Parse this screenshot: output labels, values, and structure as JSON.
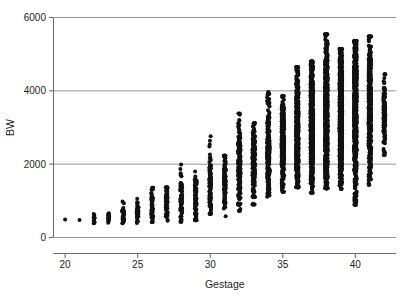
{
  "chart_data": {
    "type": "scatter",
    "title": "",
    "xlabel": "Gestage",
    "ylabel": "BW",
    "xlim": [
      19.2,
      42.8
    ],
    "ylim": [
      0,
      6000
    ],
    "xticks": [
      20,
      25,
      30,
      35,
      40
    ],
    "yticks": [
      0,
      2000,
      4000,
      6000
    ],
    "grid": "horizontal",
    "legend": "none",
    "marker": "filled-circle",
    "marker_color": "#111111",
    "marker_size_px": 3.2,
    "gridline_color": "#8a8a8a",
    "axis_color": "#6e6e6e",
    "columns": [
      {
        "x": 20,
        "n": 1,
        "min": 490,
        "max": 500,
        "median": 495
      },
      {
        "x": 21,
        "n": 1,
        "min": 480,
        "max": 495,
        "median": 490
      },
      {
        "x": 22,
        "n": 12,
        "min": 390,
        "max": 640,
        "median": 500
      },
      {
        "x": 23,
        "n": 16,
        "min": 400,
        "max": 660,
        "median": 530
      },
      {
        "x": 24,
        "n": 34,
        "min": 390,
        "max": 985,
        "median": 640
      },
      {
        "x": 25,
        "n": 42,
        "min": 395,
        "max": 1060,
        "median": 720
      },
      {
        "x": 26,
        "n": 50,
        "min": 420,
        "max": 1355,
        "median": 820
      },
      {
        "x": 27,
        "n": 56,
        "min": 455,
        "max": 1370,
        "median": 930
      },
      {
        "x": 28,
        "n": 70,
        "min": 430,
        "max": 1990,
        "median": 1050
      },
      {
        "x": 29,
        "n": 78,
        "min": 470,
        "max": 1800,
        "median": 1180
      },
      {
        "x": 30,
        "n": 96,
        "min": 650,
        "max": 2760,
        "median": 1380
      },
      {
        "x": 31,
        "n": 110,
        "min": 580,
        "max": 2230,
        "median": 1600
      },
      {
        "x": 32,
        "n": 150,
        "min": 730,
        "max": 3380,
        "median": 1820
      },
      {
        "x": 33,
        "n": 175,
        "min": 900,
        "max": 3120,
        "median": 2030
      },
      {
        "x": 34,
        "n": 230,
        "min": 1110,
        "max": 3970,
        "median": 2320
      },
      {
        "x": 35,
        "n": 300,
        "min": 1250,
        "max": 3860,
        "median": 2580
      },
      {
        "x": 36,
        "n": 430,
        "min": 1370,
        "max": 4650,
        "median": 2830
      },
      {
        "x": 37,
        "n": 640,
        "min": 1220,
        "max": 4800,
        "median": 3080
      },
      {
        "x": 38,
        "n": 860,
        "min": 1340,
        "max": 5540,
        "median": 3300
      },
      {
        "x": 39,
        "n": 950,
        "min": 1330,
        "max": 5140,
        "median": 3450
      },
      {
        "x": 40,
        "n": 820,
        "min": 890,
        "max": 5360,
        "median": 3550
      },
      {
        "x": 41,
        "n": 430,
        "min": 1440,
        "max": 5480,
        "median": 3620
      },
      {
        "x": 42,
        "n": 120,
        "min": 2250,
        "max": 4450,
        "median": 3450
      }
    ]
  }
}
